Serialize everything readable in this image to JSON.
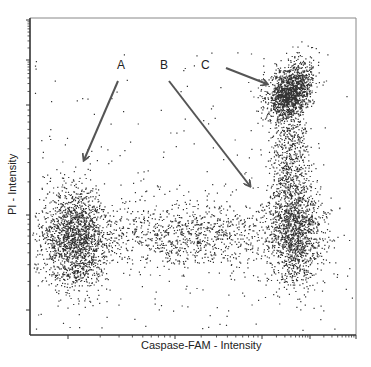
{
  "chart_data": {
    "type": "scatter",
    "title": "",
    "xlabel": "Caspase-FAM - Intensity",
    "ylabel": "PI - Intensity",
    "x_scale": "log",
    "y_scale": "log",
    "grid": false,
    "legend": null,
    "tick_labels_visible": false,
    "plot_area_px": {
      "left": 30,
      "top": 18,
      "right": 356,
      "bottom": 335
    },
    "x_decade_ticks_px": [
      68,
      175,
      262,
      310,
      356
    ],
    "y_decade_ticks_px": [
      20,
      60,
      105,
      215,
      310
    ],
    "populations": [
      {
        "id": "A",
        "description": "Live cells (low Caspase, low PI)",
        "center_px": [
          75,
          238
        ],
        "spread_px": [
          16,
          26
        ],
        "count": 1700
      },
      {
        "id": "B",
        "description": "Early apoptotic (high Caspase, low PI)",
        "center_px": [
          295,
          232
        ],
        "spread_px": [
          14,
          26
        ],
        "count": 1300
      },
      {
        "id": "C",
        "description": "Late apoptotic / necrotic (high Caspase, high PI)",
        "center_px": [
          290,
          92
        ],
        "spread_px": [
          11,
          13
        ],
        "count": 1500
      },
      {
        "id": "bridge",
        "description": "Transition band between A and B",
        "center_px": [
          185,
          235
        ],
        "spread_px": [
          60,
          18
        ],
        "count": 1100
      },
      {
        "id": "tail",
        "description": "Vertical tail between B and C",
        "center_px": [
          290,
          160
        ],
        "spread_px": [
          10,
          32
        ],
        "count": 600
      },
      {
        "id": "background",
        "description": "Sparse scattered events",
        "center_px": [
          190,
          200
        ],
        "spread_px": [
          100,
          80
        ],
        "count": 260
      }
    ],
    "annotations": [
      {
        "label": "A",
        "label_px": [
          117,
          58
        ],
        "arrow_from_px": [
          118,
          81
        ],
        "arrow_to_px": [
          84,
          160
        ]
      },
      {
        "label": "B",
        "label_px": [
          160,
          58
        ],
        "arrow_from_px": [
          169,
          81
        ],
        "arrow_to_px": [
          250,
          186
        ]
      },
      {
        "label": "C",
        "label_px": [
          201,
          58
        ],
        "arrow_from_px": [
          226,
          68
        ],
        "arrow_to_px": [
          267,
          84
        ]
      }
    ]
  },
  "colors": {
    "dot": "#111111",
    "axis": "#333333",
    "frame": "#888888",
    "arrow": "#555555"
  }
}
